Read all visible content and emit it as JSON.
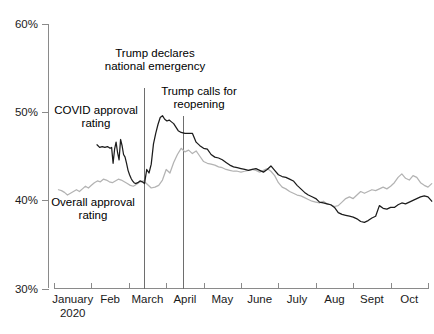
{
  "chart_data": {
    "type": "line",
    "title": "",
    "subtitle": "",
    "xlabel": "",
    "ylabel": "",
    "ylim": [
      30,
      60
    ],
    "grid": false,
    "legend_position": "inline-annotations",
    "y_ticks": [
      "30%",
      "40%",
      "50%",
      "60%"
    ],
    "y_tick_values": [
      30,
      40,
      50,
      60
    ],
    "x_ticks": [
      "January 2020",
      "Feb",
      "March",
      "April",
      "May",
      "June",
      "July",
      "Aug",
      "Sept",
      "Oct"
    ],
    "x_tick_labels_line1": [
      "January",
      "Feb",
      "March",
      "April",
      "May",
      "June",
      "July",
      "Aug",
      "Sept",
      "Oct"
    ],
    "x_tick_label_sub": "2020",
    "x_range_months": [
      0,
      10
    ],
    "series": [
      {
        "name": "COVID approval rating",
        "color": "#1c1c1c",
        "x": [
          1.15,
          1.22,
          1.29,
          1.36,
          1.43,
          1.5,
          1.54,
          1.58,
          1.62,
          1.66,
          1.7,
          1.74,
          1.78,
          1.82,
          1.86,
          1.9,
          1.94,
          1.98,
          2.02,
          2.06,
          2.1,
          2.14,
          2.18,
          2.24,
          2.3,
          2.36,
          2.42,
          2.48,
          2.54,
          2.6,
          2.66,
          2.72,
          2.78,
          2.84,
          2.9,
          2.96,
          3.02,
          3.08,
          3.14,
          3.2,
          3.26,
          3.32,
          3.4,
          3.5,
          3.6,
          3.7,
          3.8,
          3.9,
          4.0,
          4.1,
          4.2,
          4.3,
          4.4,
          4.5,
          4.6,
          4.7,
          4.8,
          4.9,
          5.0,
          5.1,
          5.2,
          5.3,
          5.4,
          5.5,
          5.6,
          5.7,
          5.8,
          5.9,
          6.0,
          6.1,
          6.2,
          6.3,
          6.4,
          6.5,
          6.6,
          6.7,
          6.8,
          6.9,
          7.0,
          7.1,
          7.2,
          7.3,
          7.4,
          7.5,
          7.6,
          7.7,
          7.8,
          7.9,
          8.0,
          8.1,
          8.2,
          8.3,
          8.4,
          8.5,
          8.6,
          8.7,
          8.8,
          8.9,
          9.0,
          9.1,
          9.2,
          9.3,
          9.4,
          9.5,
          9.6,
          9.7,
          9.8,
          9.9,
          10.0,
          10.1
        ],
        "y": [
          46.3,
          46.0,
          46.1,
          46.0,
          46.1,
          45.9,
          46.0,
          44.2,
          45.8,
          46.6,
          45.4,
          44.6,
          46.9,
          46.2,
          45.2,
          44.9,
          44.2,
          43.4,
          42.9,
          42.5,
          42.2,
          42.0,
          41.9,
          42.0,
          42.2,
          42.1,
          41.9,
          43.5,
          43.1,
          44.1,
          46.4,
          47.6,
          48.6,
          49.4,
          49.6,
          49.2,
          49.0,
          49.1,
          48.9,
          48.7,
          48.3,
          47.9,
          47.7,
          47.6,
          47.6,
          47.6,
          46.6,
          46.2,
          45.9,
          45.8,
          45.2,
          44.9,
          44.8,
          44.6,
          44.3,
          44.0,
          43.8,
          43.7,
          43.6,
          43.5,
          43.4,
          43.5,
          43.6,
          43.4,
          43.2,
          43.5,
          43.9,
          43.4,
          42.9,
          42.7,
          42.6,
          42.4,
          42.2,
          41.7,
          41.3,
          40.9,
          40.6,
          40.4,
          40.2,
          39.8,
          39.7,
          39.6,
          39.5,
          39.2,
          38.6,
          38.4,
          38.3,
          38.2,
          38.1,
          37.9,
          37.6,
          37.5,
          37.7,
          38.0,
          38.2,
          39.4,
          39.1,
          39.0,
          39.2,
          39.2,
          39.5,
          39.7,
          39.6,
          39.8,
          40.0,
          40.2,
          40.4,
          40.5,
          40.4,
          39.9
        ],
        "label": "COVID approval rating"
      },
      {
        "name": "Overall approval rating",
        "color": "#b3b3b3",
        "x": [
          0.12,
          0.2,
          0.28,
          0.36,
          0.44,
          0.52,
          0.6,
          0.68,
          0.76,
          0.84,
          0.92,
          1.0,
          1.08,
          1.16,
          1.24,
          1.32,
          1.4,
          1.48,
          1.56,
          1.64,
          1.72,
          1.8,
          1.88,
          1.96,
          2.04,
          2.12,
          2.2,
          2.3,
          2.4,
          2.5,
          2.6,
          2.7,
          2.8,
          2.9,
          3.0,
          3.1,
          3.2,
          3.3,
          3.4,
          3.5,
          3.6,
          3.7,
          3.8,
          3.9,
          4.0,
          4.1,
          4.2,
          4.3,
          4.4,
          4.5,
          4.6,
          4.7,
          4.8,
          4.9,
          5.0,
          5.1,
          5.2,
          5.3,
          5.4,
          5.5,
          5.6,
          5.7,
          5.8,
          5.9,
          6.0,
          6.1,
          6.2,
          6.3,
          6.4,
          6.5,
          6.6,
          6.7,
          6.8,
          6.9,
          7.0,
          7.1,
          7.2,
          7.3,
          7.4,
          7.5,
          7.6,
          7.7,
          7.8,
          7.9,
          8.0,
          8.1,
          8.2,
          8.3,
          8.4,
          8.5,
          8.6,
          8.7,
          8.8,
          8.9,
          9.0,
          9.1,
          9.2,
          9.3,
          9.4,
          9.5,
          9.6,
          9.7,
          9.8,
          9.9,
          10.0,
          10.1
        ],
        "y": [
          41.2,
          41.1,
          40.9,
          40.6,
          40.8,
          41.0,
          41.2,
          41.0,
          41.3,
          41.6,
          41.4,
          41.7,
          42.0,
          42.2,
          42.1,
          42.4,
          42.3,
          42.1,
          42.0,
          42.2,
          42.4,
          42.3,
          42.1,
          41.9,
          41.7,
          41.6,
          41.8,
          42.1,
          42.2,
          41.8,
          41.4,
          41.5,
          41.7,
          42.3,
          43.5,
          43.1,
          44.3,
          45.2,
          45.9,
          45.5,
          45.7,
          45.3,
          45.6,
          45.0,
          44.4,
          44.2,
          44.1,
          44.0,
          43.8,
          43.7,
          43.5,
          43.4,
          43.3,
          43.3,
          43.2,
          43.3,
          43.4,
          43.5,
          43.4,
          43.2,
          43.4,
          43.6,
          43.3,
          42.8,
          42.0,
          41.5,
          41.3,
          41.0,
          40.8,
          40.6,
          40.5,
          40.3,
          40.1,
          39.9,
          39.8,
          39.7,
          39.9,
          39.6,
          39.5,
          39.3,
          39.4,
          39.8,
          40.2,
          40.4,
          40.2,
          40.6,
          41.0,
          40.8,
          41.0,
          41.2,
          41.1,
          41.3,
          41.5,
          41.3,
          41.6,
          42.0,
          42.6,
          43.0,
          42.5,
          42.3,
          42.8,
          42.6,
          42.0,
          41.7,
          41.5,
          41.9
        ],
        "label": "Overall approval rating"
      }
    ],
    "annotations": [
      {
        "id": "national-emergency",
        "text_lines": [
          "Trump declares",
          "national emergency"
        ],
        "x_month": 2.4,
        "kind": "event-line"
      },
      {
        "id": "reopening",
        "text_lines": [
          "Trump calls for",
          "reopening"
        ],
        "x_month": 3.45,
        "kind": "event-line"
      },
      {
        "id": "covid-series-label",
        "text_lines": [
          "COVID approval",
          "rating"
        ],
        "kind": "series-label",
        "color": "#1a1a1a"
      },
      {
        "id": "overall-series-label",
        "text_lines": [
          "Overall approval",
          "rating"
        ],
        "kind": "series-label",
        "color": "#b3b3b3"
      }
    ]
  }
}
